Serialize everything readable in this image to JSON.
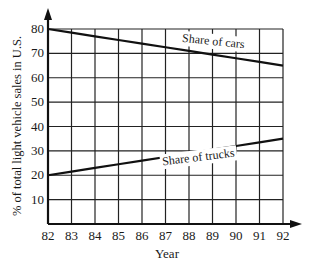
{
  "chart_data": {
    "type": "line",
    "title": "",
    "xlabel": "Year",
    "ylabel": "% of total light vehicle sales in U.S.",
    "x": [
      82,
      83,
      84,
      85,
      86,
      87,
      88,
      89,
      90,
      91,
      92
    ],
    "x_tick_labels": [
      "82",
      "83",
      "84",
      "85",
      "86",
      "87",
      "88",
      "89",
      "90",
      "91",
      "92"
    ],
    "y_tick_labels": [
      "10",
      "20",
      "30",
      "40",
      "50",
      "60",
      "70",
      "80"
    ],
    "xlim": [
      82,
      92
    ],
    "ylim": [
      0,
      80
    ],
    "grid": true,
    "legend": "inline labels",
    "series": [
      {
        "name": "Share of cars",
        "values": [
          80,
          78.5,
          77,
          75.5,
          74,
          72.5,
          71,
          69.5,
          68,
          66.5,
          65
        ]
      },
      {
        "name": "Share of trucks",
        "values": [
          20,
          21.5,
          23,
          24.5,
          26,
          27.5,
          29,
          30.5,
          32,
          33.5,
          35
        ]
      }
    ]
  },
  "labels": {
    "xlabel": "Year",
    "ylabel": "% of total light vehicle sales in U.S.",
    "cars": "Share of cars",
    "trucks": "Share of trucks",
    "yticks": [
      "80",
      "70",
      "60",
      "50",
      "40",
      "30",
      "20",
      "10"
    ],
    "xticks": [
      "82",
      "83",
      "84",
      "85",
      "86",
      "87",
      "88",
      "89",
      "90",
      "91",
      "92"
    ]
  }
}
